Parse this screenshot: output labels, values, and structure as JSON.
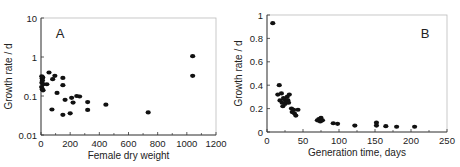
{
  "chart_data": [
    {
      "type": "scatter",
      "panel_label": "A",
      "title": "",
      "xlabel": "Female dry weight",
      "ylabel": "Growth rate / d",
      "xscale": "linear",
      "yscale": "log",
      "xlim": [
        0,
        1200
      ],
      "ylim": [
        0.01,
        10
      ],
      "xticks": [
        "0",
        "200",
        "400",
        "600",
        "800",
        "1000",
        "1200"
      ],
      "yticks": [
        "0.01",
        "0.1",
        "1",
        "10"
      ],
      "grid": false,
      "legend": null,
      "points": [
        {
          "x": 5,
          "y": 0.32
        },
        {
          "x": 8,
          "y": 0.28
        },
        {
          "x": 10,
          "y": 0.25
        },
        {
          "x": 6,
          "y": 0.22
        },
        {
          "x": 12,
          "y": 0.3
        },
        {
          "x": 4,
          "y": 0.17
        },
        {
          "x": 9,
          "y": 0.15
        },
        {
          "x": 14,
          "y": 0.14
        },
        {
          "x": 16,
          "y": 0.2
        },
        {
          "x": 40,
          "y": 0.2
        },
        {
          "x": 55,
          "y": 0.4
        },
        {
          "x": 80,
          "y": 0.27
        },
        {
          "x": 95,
          "y": 0.33
        },
        {
          "x": 75,
          "y": 0.045
        },
        {
          "x": 110,
          "y": 0.12
        },
        {
          "x": 150,
          "y": 0.29
        },
        {
          "x": 150,
          "y": 0.19
        },
        {
          "x": 165,
          "y": 0.08
        },
        {
          "x": 150,
          "y": 0.033
        },
        {
          "x": 200,
          "y": 0.036
        },
        {
          "x": 210,
          "y": 0.09
        },
        {
          "x": 220,
          "y": 0.068
        },
        {
          "x": 245,
          "y": 0.1
        },
        {
          "x": 265,
          "y": 0.097
        },
        {
          "x": 320,
          "y": 0.07
        },
        {
          "x": 320,
          "y": 0.044
        },
        {
          "x": 445,
          "y": 0.06
        },
        {
          "x": 735,
          "y": 0.038
        },
        {
          "x": 1040,
          "y": 1.05
        },
        {
          "x": 1040,
          "y": 0.33
        }
      ]
    },
    {
      "type": "scatter",
      "panel_label": "B",
      "title": "",
      "xlabel": "Generation time, days",
      "ylabel": "Growth rate / d",
      "xscale": "linear",
      "yscale": "linear",
      "xlim": [
        0,
        250
      ],
      "ylim": [
        0,
        1
      ],
      "xticks": [
        "0",
        "50",
        "100",
        "150",
        "200",
        "250"
      ],
      "yticks": [
        "0",
        "0.2",
        "0.4",
        "0.6",
        "0.8",
        "1"
      ],
      "grid": false,
      "legend": null,
      "points": [
        {
          "x": 8,
          "y": 0.93
        },
        {
          "x": 17,
          "y": 0.4
        },
        {
          "x": 15,
          "y": 0.32
        },
        {
          "x": 20,
          "y": 0.33
        },
        {
          "x": 18,
          "y": 0.27
        },
        {
          "x": 21,
          "y": 0.25
        },
        {
          "x": 22,
          "y": 0.22
        },
        {
          "x": 24,
          "y": 0.28
        },
        {
          "x": 25,
          "y": 0.24
        },
        {
          "x": 27,
          "y": 0.26
        },
        {
          "x": 28,
          "y": 0.3
        },
        {
          "x": 29,
          "y": 0.27
        },
        {
          "x": 30,
          "y": 0.25
        },
        {
          "x": 31,
          "y": 0.32
        },
        {
          "x": 23,
          "y": 0.29
        },
        {
          "x": 34,
          "y": 0.2
        },
        {
          "x": 35,
          "y": 0.17
        },
        {
          "x": 37,
          "y": 0.19
        },
        {
          "x": 38,
          "y": 0.16
        },
        {
          "x": 40,
          "y": 0.14
        },
        {
          "x": 43,
          "y": 0.19
        },
        {
          "x": 70,
          "y": 0.1
        },
        {
          "x": 72,
          "y": 0.11
        },
        {
          "x": 74,
          "y": 0.09
        },
        {
          "x": 75,
          "y": 0.12
        },
        {
          "x": 77,
          "y": 0.1
        },
        {
          "x": 92,
          "y": 0.075
        },
        {
          "x": 98,
          "y": 0.07
        },
        {
          "x": 122,
          "y": 0.055
        },
        {
          "x": 152,
          "y": 0.08
        },
        {
          "x": 152,
          "y": 0.055
        },
        {
          "x": 165,
          "y": 0.05
        },
        {
          "x": 180,
          "y": 0.045
        },
        {
          "x": 205,
          "y": 0.045
        }
      ]
    }
  ]
}
